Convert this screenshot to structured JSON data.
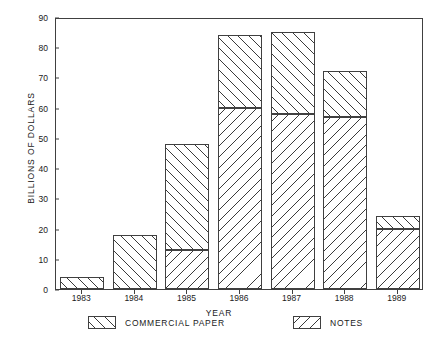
{
  "chart_data": {
    "type": "bar",
    "stacked": true,
    "title": "",
    "xlabel": "YEAR",
    "ylabel": "BILLIONS OF DOLLARS",
    "categories": [
      "1983",
      "1984",
      "1985",
      "1986",
      "1987",
      "1988",
      "1989"
    ],
    "ylim": [
      0,
      90
    ],
    "yticks": [
      0,
      10,
      20,
      30,
      40,
      50,
      60,
      70,
      80,
      90
    ],
    "ytick_labels": [
      "0",
      "10",
      "20",
      "30",
      "40",
      "50",
      "60",
      "70",
      "80",
      "90"
    ],
    "grid": false,
    "legend_position": "below",
    "series": [
      {
        "name": "NOTES",
        "hatch": "backslash",
        "values": [
          0,
          0,
          13,
          60,
          58,
          57,
          20
        ]
      },
      {
        "name": "COMMERCIAL PAPER",
        "hatch": "slash",
        "values": [
          4,
          18,
          35,
          24,
          27,
          15,
          4
        ]
      }
    ],
    "totals": [
      4,
      18,
      48,
      84,
      85,
      72,
      24
    ]
  },
  "legend": {
    "entries": [
      {
        "label": "COMMERCIAL PAPER",
        "swatch": "slash-hatch-swatch"
      },
      {
        "label": "NOTES",
        "swatch": "backslash-hatch-swatch"
      }
    ]
  },
  "colors": {
    "axis": "#404040",
    "hatch": "#3a3a3a",
    "background": "#ffffff"
  }
}
